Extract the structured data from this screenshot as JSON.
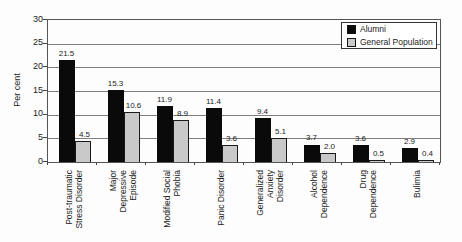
{
  "chart_data": {
    "type": "bar",
    "title": "",
    "ylabel": "Per cent",
    "ylim": [
      0,
      30
    ],
    "yticks": [
      0,
      5,
      10,
      15,
      20,
      25,
      30
    ],
    "grid": true,
    "legend_position": "top-right-inside",
    "value_labels_shown": true,
    "categories": [
      "Post-traumatic\nStress Disorder",
      "Major\nDepressive\nEpisode",
      "Modified Social\nPhobia",
      "Panic Disorder",
      "Generalized\nAnxiety\nDisorder",
      "Alcohol\nDependence",
      "Drug\nDependence",
      "Bulimia"
    ],
    "series": [
      {
        "name": "Alumni",
        "color": "#0a0a0a",
        "values": [
          21.5,
          15.3,
          11.9,
          11.4,
          9.4,
          3.7,
          3.6,
          2.9
        ]
      },
      {
        "name": "General Population",
        "color": "#c9c9c9",
        "values": [
          4.5,
          10.6,
          8.9,
          3.6,
          5.1,
          2.0,
          0.5,
          0.4
        ]
      }
    ]
  },
  "colors": {
    "gridline": "#7e7e7e",
    "axis_border": "#555555",
    "text": "#1c1c1c",
    "legend_border": "#333333",
    "background": "#fdfdfd"
  }
}
